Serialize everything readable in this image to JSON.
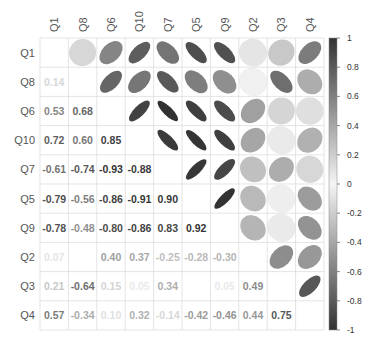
{
  "chart_data": {
    "type": "heatmap",
    "subtype": "correlation-mixed (lower: numbers, upper: ellipses)",
    "title": "",
    "variables": [
      "Q1",
      "Q8",
      "Q6",
      "Q10",
      "Q7",
      "Q5",
      "Q9",
      "Q2",
      "Q3",
      "Q4"
    ],
    "matrix": [
      [
        1.0,
        0.14,
        0.53,
        0.72,
        -0.61,
        -0.79,
        -0.78,
        0.07,
        0.21,
        0.57
      ],
      [
        0.14,
        1.0,
        0.68,
        0.6,
        -0.74,
        -0.56,
        -0.48,
        0.02,
        -0.64,
        -0.34
      ],
      [
        0.53,
        0.68,
        1.0,
        0.85,
        -0.93,
        -0.86,
        -0.8,
        0.4,
        0.15,
        0.1
      ],
      [
        0.72,
        0.6,
        0.85,
        1.0,
        -0.88,
        -0.91,
        -0.86,
        0.37,
        0.05,
        0.32
      ],
      [
        -0.61,
        -0.74,
        -0.93,
        -0.88,
        1.0,
        0.9,
        0.83,
        -0.25,
        0.34,
        -0.14
      ],
      [
        -0.79,
        -0.56,
        -0.86,
        -0.91,
        0.9,
        1.0,
        0.92,
        -0.28,
        0.03,
        -0.42
      ],
      [
        -0.78,
        -0.48,
        -0.8,
        -0.86,
        0.83,
        0.92,
        1.0,
        -0.3,
        0.05,
        -0.46
      ],
      [
        0.07,
        0.02,
        0.4,
        0.37,
        -0.25,
        -0.28,
        -0.3,
        1.0,
        0.49,
        0.44
      ],
      [
        0.21,
        -0.64,
        0.15,
        0.05,
        0.34,
        0.03,
        0.05,
        0.49,
        1.0,
        0.75
      ],
      [
        0.57,
        -0.34,
        0.1,
        0.32,
        -0.14,
        -0.42,
        -0.46,
        0.44,
        0.75,
        1.0
      ]
    ],
    "colorbar": {
      "ticks": [
        "1",
        "0.8",
        "0.6",
        "0.4",
        "0.2",
        "0",
        "-0.2",
        "-0.4",
        "-0.6",
        "-0.8",
        "-1"
      ],
      "range": [
        -1,
        1
      ],
      "palette": [
        "#1a1a1a",
        "#ffffff",
        "#1a1a1a"
      ]
    },
    "legend_position": "right",
    "grid": true
  }
}
